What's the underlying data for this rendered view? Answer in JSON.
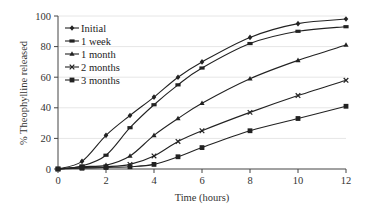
{
  "chart_data": {
    "type": "line",
    "title": "",
    "xlabel": "Time (hours)",
    "ylabel": "% Theophylline released",
    "xlim": [
      0,
      12
    ],
    "ylim": [
      0,
      100
    ],
    "xticks": [
      0,
      2,
      4,
      6,
      8,
      10,
      12
    ],
    "yticks": [
      0,
      20,
      40,
      60,
      80,
      100
    ],
    "grid": "horizontal",
    "legend_position": "upper left",
    "x": [
      0,
      1,
      2,
      3,
      4,
      5,
      6,
      8,
      10,
      12
    ],
    "series": [
      {
        "name": "Initial",
        "marker": "diamond",
        "values": [
          0,
          5,
          22,
          35,
          47,
          60,
          70,
          86,
          95,
          98
        ]
      },
      {
        "name": "1 week",
        "marker": "rect",
        "values": [
          0,
          2,
          9,
          27,
          42,
          55,
          66,
          82,
          90,
          93
        ]
      },
      {
        "name": "1 month",
        "marker": "triangle",
        "values": [
          0,
          1.5,
          2.5,
          8.5,
          22,
          33,
          43,
          59,
          71,
          81
        ]
      },
      {
        "name": "2 months",
        "marker": "x",
        "values": [
          0,
          1,
          1.5,
          3,
          8.5,
          18,
          25,
          37,
          48,
          58
        ]
      },
      {
        "name": "3 months",
        "marker": "square",
        "values": [
          0,
          0.5,
          1,
          1.5,
          3,
          8,
          14,
          25,
          33,
          41
        ]
      }
    ]
  },
  "colors": {
    "line": "#222222",
    "grid": "#e6e6e6",
    "axis": "#444444"
  }
}
